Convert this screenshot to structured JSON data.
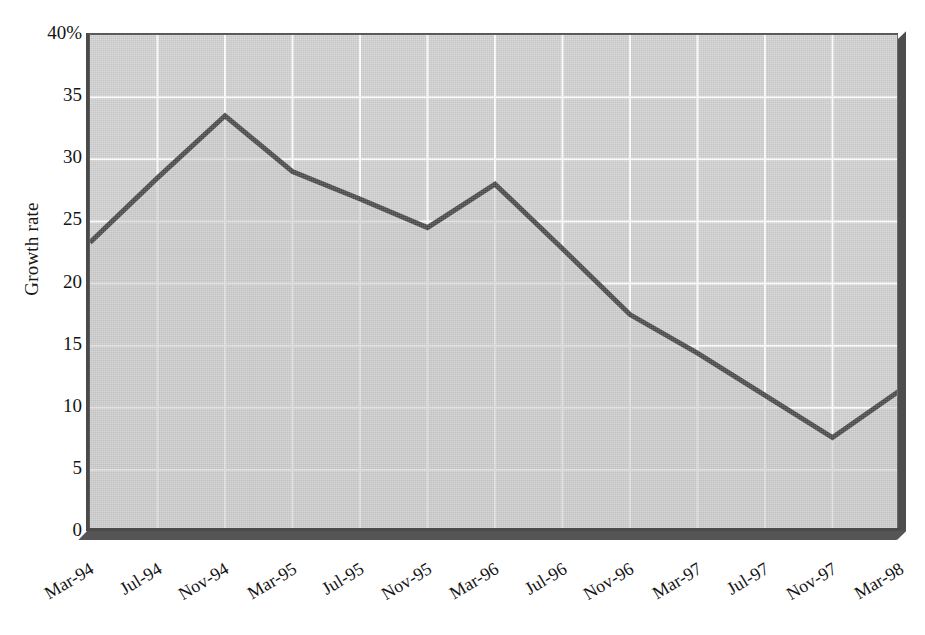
{
  "chart_data": {
    "type": "area",
    "title": "",
    "subtitle": "",
    "xlabel": "",
    "ylabel": "Growth rate",
    "ylim": [
      0,
      40
    ],
    "y_ticks": [
      "0",
      "5",
      "10",
      "15",
      "20",
      "25",
      "30",
      "35",
      "40%"
    ],
    "y_tick_values": [
      0,
      5,
      10,
      15,
      20,
      25,
      30,
      35,
      40
    ],
    "grid": true,
    "grid_color": "#ffffff",
    "legend": "none",
    "area_fill_color": "#d2d2d2",
    "line_color": "#4a4a4a",
    "categories": [
      "Mar-94",
      "Jul-94",
      "Nov-94",
      "Mar-95",
      "Jul-95",
      "Nov-95",
      "Mar-96",
      "Jul-96",
      "Nov-96",
      "Mar-97",
      "Jul-97",
      "Nov-97",
      "Mar-98"
    ],
    "values": [
      23.3,
      28.5,
      33.5,
      29.0,
      26.8,
      24.5,
      28.0,
      22.8,
      17.5,
      14.4,
      11.0,
      7.6,
      11.4
    ],
    "series": [
      {
        "name": "Growth rate",
        "values": [
          23.3,
          28.5,
          33.5,
          29.0,
          26.8,
          24.5,
          28.0,
          22.8,
          17.5,
          14.4,
          11.0,
          7.6,
          11.4
        ]
      }
    ],
    "annotations": []
  },
  "axis": {
    "y_title": "Growth rate"
  }
}
